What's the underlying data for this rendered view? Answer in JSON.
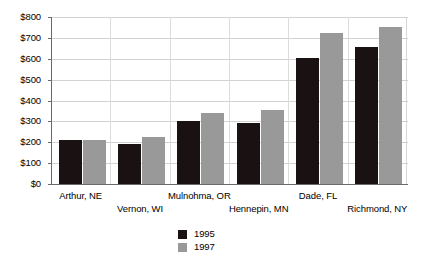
{
  "chart_data": {
    "type": "bar",
    "title": "",
    "xlabel": "",
    "ylabel": "",
    "ylim": [
      0,
      800
    ],
    "ytick_step": 100,
    "grid": true,
    "legend_position": "bottom-center",
    "categories": [
      "Arthur, NE",
      "Vernon, WI",
      "Mulnohma, OR",
      "Hennepin, MN",
      "Dade, FL",
      "Richmond, NY"
    ],
    "ytick_labels": [
      "$800",
      "$700",
      "$600",
      "$500",
      "$400",
      "$300",
      "$200",
      "$100",
      "$0"
    ],
    "ytick_values": [
      800,
      700,
      600,
      500,
      400,
      300,
      200,
      100,
      0
    ],
    "series": [
      {
        "name": "1995",
        "color": "#1a1113",
        "values": [
          210,
          190,
          300,
          290,
          605,
          655
        ]
      },
      {
        "name": "1997",
        "color": "#999999",
        "values": [
          210,
          225,
          340,
          355,
          725,
          750
        ]
      }
    ]
  },
  "legend": {
    "items": [
      {
        "label": "1995",
        "color": "#1a1113"
      },
      {
        "label": "1997",
        "color": "#999999"
      }
    ]
  },
  "axis": {
    "line_color": "#6a6a6a",
    "grid_color": "#d2d2d2"
  }
}
